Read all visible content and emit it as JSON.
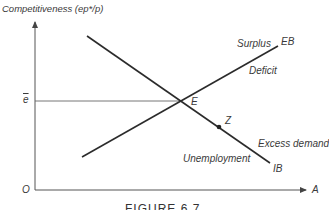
{
  "diagram": {
    "y_axis_label": "Competitiveness (ep*/p)",
    "x_axis_label": "A",
    "origin_label": "O",
    "e_bar_label": "e",
    "curves": [
      {
        "name": "EB",
        "label": "EB",
        "from": [
          82,
          157
        ],
        "to": [
          278,
          46
        ]
      },
      {
        "name": "IB",
        "label": "IB",
        "from": [
          87,
          36
        ],
        "to": [
          270,
          163
        ]
      }
    ],
    "points": [
      {
        "name": "E",
        "label": "E",
        "at": [
          180,
          101
        ]
      },
      {
        "name": "Z",
        "label": "Z",
        "at": [
          219,
          127
        ]
      }
    ],
    "regions": {
      "surplus": "Surplus",
      "deficit": "Deficit",
      "excess_demand": "Excess demand",
      "unemployment": "Unemployment"
    },
    "caption": "FIGURE 6.7",
    "colors": {
      "line": "#2b2b2b",
      "axis": "#555555",
      "text": "#3a3a3a"
    }
  }
}
